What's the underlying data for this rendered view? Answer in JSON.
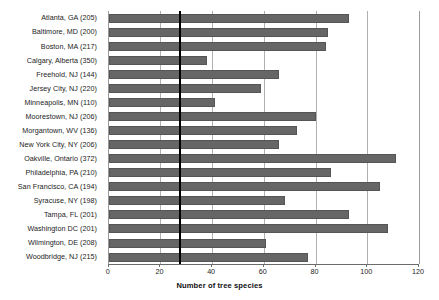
{
  "chart_data": {
    "type": "bar",
    "orientation": "horizontal",
    "title": "",
    "xlabel": "Number of tree species",
    "ylabel": "",
    "xlim": [
      0,
      120
    ],
    "xticks": [
      0,
      20,
      40,
      60,
      80,
      100,
      120
    ],
    "xtick_labels": [
      "0",
      "20",
      "40",
      "60",
      "80",
      "100",
      "120"
    ],
    "grid": "vertical gridlines at 20-unit intervals",
    "legend": "none",
    "bar_color": "#666666",
    "reference_line": {
      "value": 27.6,
      "color": "#000000",
      "label": ""
    },
    "categories": [
      "Atlanta, GA (205)",
      "Baltimore, MD (200)",
      "Boston, MA (217)",
      "Calgary, Alberta (350)",
      "Freehold, NJ (144)",
      "Jersey City, NJ (220)",
      "Minneapolis, MN (110)",
      "Moorestown, NJ (206)",
      "Morgantown, WV (136)",
      "New York City, NY (206)",
      "Oakville, Ontario (372)",
      "Philadelphia, PA (210)",
      "San Francisco, CA (194)",
      "Syracuse, NY (198)",
      "Tampa, FL (201)",
      "Washington DC (201)",
      "Wilmington, DE (208)",
      "Woodbridge, NJ (215)"
    ],
    "values": [
      93,
      85,
      84,
      38,
      66,
      59,
      41,
      80,
      73,
      66,
      111,
      86,
      105,
      68,
      93,
      108,
      61,
      77
    ]
  }
}
